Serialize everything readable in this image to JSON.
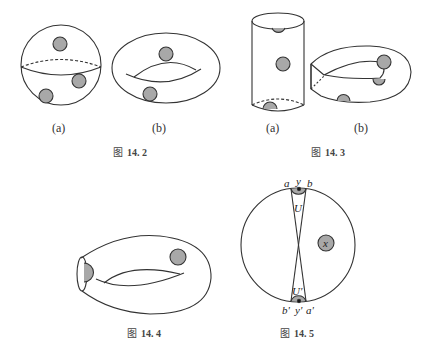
{
  "figures": [
    {
      "id": "14.2",
      "caption_prefix": "图",
      "caption_number": "14. 2",
      "panels": [
        "(a)",
        "(b)"
      ],
      "panel_a": "sphere with three shaded disks",
      "panel_b": "torus with two shaded disks"
    },
    {
      "id": "14.3",
      "caption_prefix": "图",
      "caption_number": "14. 3",
      "panels": [
        "(a)",
        "(b)"
      ],
      "panel_a": "cylinder with shaded disks",
      "panel_b": "twisted torus with shaded disks"
    },
    {
      "id": "14.4",
      "caption_prefix": "图",
      "caption_number": "14. 4",
      "panel": "torus cut open with two shaded disks"
    },
    {
      "id": "14.5",
      "caption_prefix": "图",
      "caption_number": "14. 5",
      "labels": {
        "a": "a",
        "y": "y",
        "b": "b",
        "U": "U",
        "x": "x",
        "U_prime": "U'",
        "b_prime": "b'",
        "y_prime": "y'",
        "a_prime": "a'"
      }
    }
  ],
  "colors": {
    "stroke": "#333333",
    "disk_fill": "#a8a8a8",
    "background": "#ffffff"
  }
}
